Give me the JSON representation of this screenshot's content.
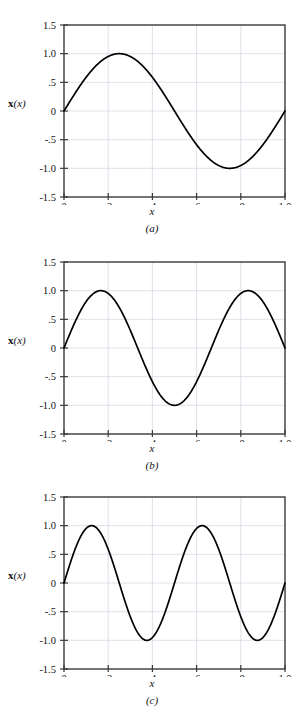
{
  "figure": {
    "background": "#ffffff",
    "curve_color": "#000000",
    "axis_color": "#3a3a3a",
    "grid_color": "#d8d8e4"
  },
  "axes": {
    "y_ticks": [
      "1.5",
      "1.0",
      ".5",
      "0",
      "-.5",
      "-1.0",
      "-1.5"
    ],
    "y_values": [
      1.5,
      1.0,
      0.5,
      0.0,
      -0.5,
      -1.0,
      -1.5
    ],
    "x_ticks": [
      "0",
      ".2",
      ".4",
      ".6",
      ".8",
      "1.0"
    ],
    "x_values": [
      0,
      0.2,
      0.4,
      0.6,
      0.8,
      1.0
    ],
    "y_axis_label_bold": "x",
    "y_axis_label_rest": "(x)",
    "x_axis_label": "x",
    "xlim": [
      0,
      1
    ],
    "ylim": [
      -1.5,
      1.5
    ]
  },
  "panels": [
    {
      "id": "a",
      "caption": "(a)",
      "chart_data": {
        "type": "line",
        "title": "",
        "xlabel": "x",
        "ylabel": "x(x)",
        "xlim": [
          0,
          1
        ],
        "ylim": [
          -1.5,
          1.5
        ],
        "grid": true,
        "legend": "none",
        "xticks": [
          0,
          0.2,
          0.4,
          0.6,
          0.8,
          1.0
        ],
        "xticklabels": [
          "0",
          ".2",
          ".4",
          ".6",
          ".8",
          "1.0"
        ],
        "yticks": [
          -1.5,
          -1.0,
          -0.5,
          0,
          0.5,
          1.0,
          1.5
        ],
        "yticklabels": [
          "-1.5",
          "-1.0",
          "-.5",
          "0",
          ".5",
          "1.0",
          "1.5"
        ],
        "series": [
          {
            "name": "mode 1",
            "formula": "sin(2*pi*x)",
            "amplitude": 1.0,
            "cycles": 1,
            "peaks_x": [
              0.26
            ],
            "troughs_x": [
              0.76
            ],
            "zero_crossings_x": [
              0.0,
              0.51,
              1.0
            ],
            "x": [
              0.0,
              0.02,
              0.04,
              0.06,
              0.08,
              0.1,
              0.12,
              0.14,
              0.16,
              0.18,
              0.2,
              0.22,
              0.24,
              0.26,
              0.28,
              0.3,
              0.32,
              0.34,
              0.36,
              0.38,
              0.4,
              0.42,
              0.44,
              0.46,
              0.48,
              0.5,
              0.52,
              0.54,
              0.56,
              0.58,
              0.6,
              0.62,
              0.64,
              0.66,
              0.68,
              0.7,
              0.72,
              0.74,
              0.76,
              0.78,
              0.8,
              0.82,
              0.84,
              0.86,
              0.88,
              0.9,
              0.92,
              0.94,
              0.96,
              0.98,
              1.0
            ],
            "y": [
              0.0,
              0.156,
              0.309,
              0.454,
              0.588,
              0.707,
              0.809,
              0.891,
              0.951,
              0.988,
              1.0,
              0.988,
              0.951,
              0.891,
              0.809,
              0.707,
              0.588,
              0.454,
              0.309,
              0.156,
              0.0,
              -0.156,
              -0.309,
              -0.454,
              -0.588,
              -0.707,
              -0.809,
              -0.891,
              -0.951,
              -0.988,
              -1.0,
              -0.988,
              -0.951,
              -0.891,
              -0.809,
              -0.707,
              -0.588,
              -0.454,
              -0.309,
              -0.156,
              0.0,
              0.156,
              0.309,
              0.454,
              0.588,
              0.707,
              0.809,
              0.891,
              0.951,
              0.988,
              1.0
            ]
          }
        ]
      }
    },
    {
      "id": "b",
      "caption": "(b)",
      "chart_data": {
        "type": "line",
        "title": "",
        "xlabel": "x",
        "ylabel": "x(x)",
        "xlim": [
          0,
          1
        ],
        "ylim": [
          -1.5,
          1.5
        ],
        "grid": true,
        "legend": "none",
        "xticks": [
          0,
          0.2,
          0.4,
          0.6,
          0.8,
          1.0
        ],
        "xticklabels": [
          "0",
          ".2",
          ".4",
          ".6",
          ".8",
          "1.0"
        ],
        "yticks": [
          -1.5,
          -1.0,
          -0.5,
          0,
          0.5,
          1.0,
          1.5
        ],
        "yticklabels": [
          "-1.5",
          "-1.0",
          "-.5",
          "0",
          ".5",
          "1.0",
          "1.5"
        ],
        "series": [
          {
            "name": "mode 2",
            "formula": "sin(3*pi*x)",
            "amplitude": 1.0,
            "cycles": 1.5,
            "peaks_x": [
              0.17,
              0.84
            ],
            "troughs_x": [
              0.5
            ],
            "zero_crossings_x": [
              0.0,
              0.335,
              0.67,
              1.0
            ],
            "x": [
              0.0,
              0.02,
              0.04,
              0.06,
              0.08,
              0.1,
              0.12,
              0.14,
              0.16,
              0.18,
              0.2,
              0.22,
              0.24,
              0.26,
              0.28,
              0.3,
              0.32,
              0.34,
              0.36,
              0.38,
              0.4,
              0.42,
              0.44,
              0.46,
              0.48,
              0.5,
              0.52,
              0.54,
              0.56,
              0.58,
              0.6,
              0.62,
              0.64,
              0.66,
              0.68,
              0.7,
              0.72,
              0.74,
              0.76,
              0.78,
              0.8,
              0.82,
              0.84,
              0.86,
              0.88,
              0.9,
              0.92,
              0.94,
              0.96,
              0.98,
              1.0
            ],
            "y": [
              0.0,
              0.187,
              0.368,
              0.536,
              0.685,
              0.809,
              0.905,
              0.969,
              0.998,
              0.992,
              0.951,
              0.876,
              0.771,
              0.637,
              0.482,
              0.309,
              0.125,
              -0.063,
              -0.249,
              -0.426,
              -0.588,
              -0.729,
              -0.844,
              -0.929,
              -0.981,
              -1.0,
              -0.981,
              -0.929,
              -0.844,
              -0.729,
              -0.588,
              -0.426,
              -0.249,
              -0.063,
              0.125,
              0.309,
              0.482,
              0.637,
              0.771,
              0.876,
              0.951,
              0.992,
              0.998,
              0.969,
              0.905,
              0.809,
              0.685,
              0.536,
              0.368,
              0.187,
              0.0
            ]
          }
        ]
      }
    },
    {
      "id": "c",
      "caption": "(c)",
      "chart_data": {
        "type": "line",
        "title": "",
        "xlabel": "x",
        "ylabel": "x(x)",
        "xlim": [
          0,
          1
        ],
        "ylim": [
          -1.5,
          1.5
        ],
        "grid": true,
        "legend": "none",
        "xticks": [
          0,
          0.2,
          0.4,
          0.6,
          0.8,
          1.0
        ],
        "xticklabels": [
          "0",
          ".2",
          ".4",
          ".6",
          ".8",
          "1.0"
        ],
        "yticks": [
          -1.5,
          -1.0,
          -0.5,
          0,
          0.5,
          1.0,
          1.5
        ],
        "yticklabels": [
          "-1.5",
          "-1.0",
          "-.5",
          "0",
          ".5",
          "1.0",
          "1.5"
        ],
        "series": [
          {
            "name": "mode 3",
            "formula": "sin(4*pi*x)",
            "amplitude": 1.0,
            "cycles": 2,
            "peaks_x": [
              0.12,
              0.62
            ],
            "troughs_x": [
              0.37,
              0.87
            ],
            "zero_crossings_x": [
              0.0,
              0.25,
              0.5,
              0.75,
              1.0
            ],
            "x": [
              0.0,
              0.02,
              0.04,
              0.06,
              0.08,
              0.1,
              0.12,
              0.14,
              0.16,
              0.18,
              0.2,
              0.22,
              0.24,
              0.26,
              0.28,
              0.3,
              0.32,
              0.34,
              0.36,
              0.38,
              0.4,
              0.42,
              0.44,
              0.46,
              0.48,
              0.5,
              0.52,
              0.54,
              0.56,
              0.58,
              0.6,
              0.62,
              0.64,
              0.66,
              0.68,
              0.7,
              0.72,
              0.74,
              0.76,
              0.78,
              0.8,
              0.82,
              0.84,
              0.86,
              0.88,
              0.9,
              0.92,
              0.94,
              0.96,
              0.98,
              1.0
            ],
            "y": [
              0.0,
              0.249,
              0.482,
              0.685,
              0.844,
              0.951,
              0.998,
              0.982,
              0.905,
              0.771,
              0.588,
              0.368,
              0.125,
              -0.125,
              -0.368,
              -0.588,
              -0.771,
              -0.905,
              -0.982,
              -0.998,
              -0.951,
              -0.844,
              -0.685,
              -0.482,
              -0.249,
              0.0,
              0.249,
              0.482,
              0.685,
              0.844,
              0.951,
              0.998,
              0.982,
              0.905,
              0.771,
              0.588,
              0.368,
              0.125,
              -0.125,
              -0.368,
              -0.588,
              -0.771,
              -0.905,
              -0.982,
              -0.998,
              -0.951,
              -0.844,
              -0.685,
              -0.482,
              -0.249,
              0.0
            ]
          }
        ]
      }
    }
  ]
}
